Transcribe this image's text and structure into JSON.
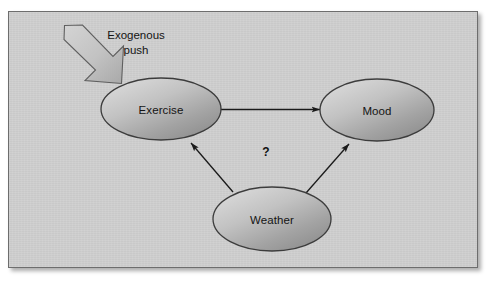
{
  "figure": {
    "type": "causal-diagram",
    "background_color": "#cfcfcf",
    "border_color": "#6d6d6d",
    "node_fill_light": "#d8d8d8",
    "node_fill_dark": "#8f8f8f",
    "node_stroke": "#3c3c3c",
    "arrow_color": "#1a1a1a"
  },
  "nodes": [
    {
      "id": "exercise",
      "label": "Exercise",
      "cx": 152,
      "cy": 97,
      "rx": 60,
      "ry": 31
    },
    {
      "id": "mood",
      "label": "Mood",
      "cx": 368,
      "cy": 98,
      "rx": 57,
      "ry": 31
    },
    {
      "id": "weather",
      "label": "Weather",
      "cx": 263,
      "cy": 207,
      "rx": 59,
      "ry": 32
    }
  ],
  "edges": [
    {
      "id": "exercise-to-mood",
      "from": "exercise",
      "to": "mood",
      "label": ""
    },
    {
      "id": "weather-to-exercise",
      "from": "weather",
      "to": "exercise",
      "label": ""
    },
    {
      "id": "weather-to-mood",
      "from": "weather",
      "to": "mood",
      "label": ""
    }
  ],
  "annotations": {
    "exogenous_push": {
      "line1": "Exogenous",
      "line2": "push",
      "x": 127,
      "y": 16
    },
    "question_mark": {
      "text": "?",
      "x": 257,
      "y": 140
    }
  },
  "block_arrow": {
    "id": "exogenous-push-arrow",
    "description": "thick block arrow pointing down-right into Exercise",
    "fill": "#c6c6c6",
    "stroke": "#5a5a5a"
  }
}
